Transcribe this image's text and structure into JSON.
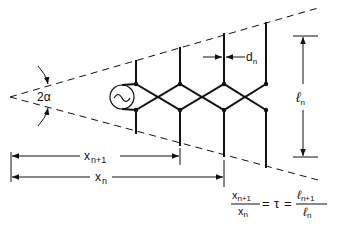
{
  "diagram": {
    "labels": {
      "angle": "2α",
      "spacing": "d",
      "spacing_sub": "n",
      "length": "ℓ",
      "length_sub": "n",
      "x_next": "x",
      "x_next_sub": "n+1",
      "x_n": "x",
      "x_n_sub": "n"
    },
    "formula": {
      "num_left": "x",
      "num_left_sub": "n+1",
      "den_left": "x",
      "den_left_sub": "n",
      "eq1": "=",
      "tau": "τ",
      "eq2": "=",
      "num_right": "ℓ",
      "num_right_sub": "n+1",
      "den_right": "ℓ",
      "den_right_sub": "n"
    },
    "source_symbol": "~",
    "colors": {
      "line": "#111111",
      "background": "#ffffff"
    }
  }
}
